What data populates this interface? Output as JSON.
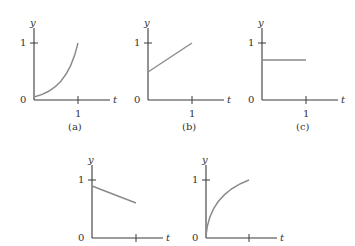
{
  "figure": {
    "panels": [
      {
        "id": "a",
        "caption": "(a)",
        "y_label": "y",
        "t_label": "t",
        "y_tick": "1",
        "t_tick": "1",
        "origin": "0",
        "shape": "convex increasing curve from ~0.05 to 1"
      },
      {
        "id": "b",
        "caption": "(b)",
        "y_label": "y",
        "t_label": "t",
        "y_tick": "1",
        "t_tick": "1",
        "origin": "0",
        "shape": "straight line from 0.5 to 1"
      },
      {
        "id": "c",
        "caption": "(c)",
        "y_label": "y",
        "t_label": "t",
        "y_tick": "1",
        "t_tick": "1",
        "origin": "0",
        "shape": "horizontal line at ~0.7"
      },
      {
        "id": "d",
        "caption": "",
        "y_label": "y",
        "t_label": "t",
        "y_tick": "1",
        "t_tick": "",
        "origin": "0",
        "shape": "straight line decreasing from ~0.85 to ~0.6"
      },
      {
        "id": "e",
        "caption": "",
        "y_label": "y",
        "t_label": "t",
        "y_tick": "1",
        "t_tick": "",
        "origin": "0",
        "shape": "concave increasing curve from 0 to 1"
      }
    ],
    "colors": {
      "axis": "#3a3a3a",
      "curve": "#8a8a8a",
      "text": "#333333"
    }
  }
}
